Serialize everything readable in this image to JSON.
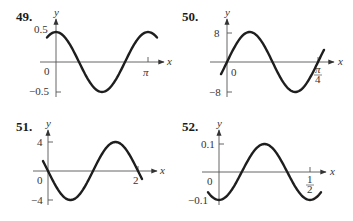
{
  "chart_data": [
    {
      "type": "line",
      "id": "49",
      "label": "49.",
      "function_shape": "0.5*cos(2x)",
      "xlabel": "x",
      "ylabel": "y",
      "y_ticks": [
        "0.5",
        "-0.5"
      ],
      "x_ticks": [
        "π"
      ],
      "origin_label": "0",
      "ylim": [
        -0.5,
        0.5
      ],
      "xlim": [
        -0.3,
        3.3
      ],
      "amplitude": 0.5,
      "period": "π",
      "grid": false
    },
    {
      "type": "line",
      "id": "50",
      "label": "50.",
      "function_shape": "8*sin(8x)",
      "xlabel": "x",
      "ylabel": "y",
      "y_ticks": [
        "8",
        "-8"
      ],
      "x_ticks": [
        "π/4"
      ],
      "origin_label": "0",
      "ylim": [
        -8,
        8
      ],
      "xlim": [
        -0.05,
        0.83
      ],
      "amplitude": 8,
      "period": "π/4",
      "grid": false
    },
    {
      "type": "line",
      "id": "51",
      "label": "51.",
      "function_shape": "-4*sin(πx)",
      "xlabel": "x",
      "ylabel": "y",
      "y_ticks": [
        "4",
        "-4"
      ],
      "x_ticks": [
        "2"
      ],
      "origin_label": "0",
      "ylim": [
        -4,
        4
      ],
      "xlim": [
        -0.1,
        2.1
      ],
      "amplitude": 4,
      "period": 2,
      "grid": false
    },
    {
      "type": "line",
      "id": "52",
      "label": "52.",
      "function_shape": "-0.1*cos(4πx)",
      "xlabel": "x",
      "ylabel": "y",
      "y_ticks": [
        "0.1",
        "-0.1"
      ],
      "x_ticks": [
        "1/2"
      ],
      "origin_label": "0",
      "ylim": [
        -0.1,
        0.1
      ],
      "xlim": [
        -0.06,
        0.56
      ],
      "amplitude": 0.1,
      "period": 0.5,
      "grid": false
    }
  ],
  "labels": {
    "p49": "49.",
    "p50": "50.",
    "p51": "51.",
    "p52": "52.",
    "x": "x",
    "y": "y",
    "zero": "0",
    "g49_top": "0.5",
    "g49_bot": "−0.5",
    "g49_xtick": "π",
    "g50_top": "8",
    "g50_bot": "−8",
    "g50_xtick_num": "π",
    "g50_xtick_den": "4",
    "g51_top": "4",
    "g51_bot": "−4",
    "g51_xtick": "2",
    "g52_top": "0.1",
    "g52_bot": "−0.1",
    "g52_xtick_num": "1",
    "g52_xtick_den": "2"
  }
}
